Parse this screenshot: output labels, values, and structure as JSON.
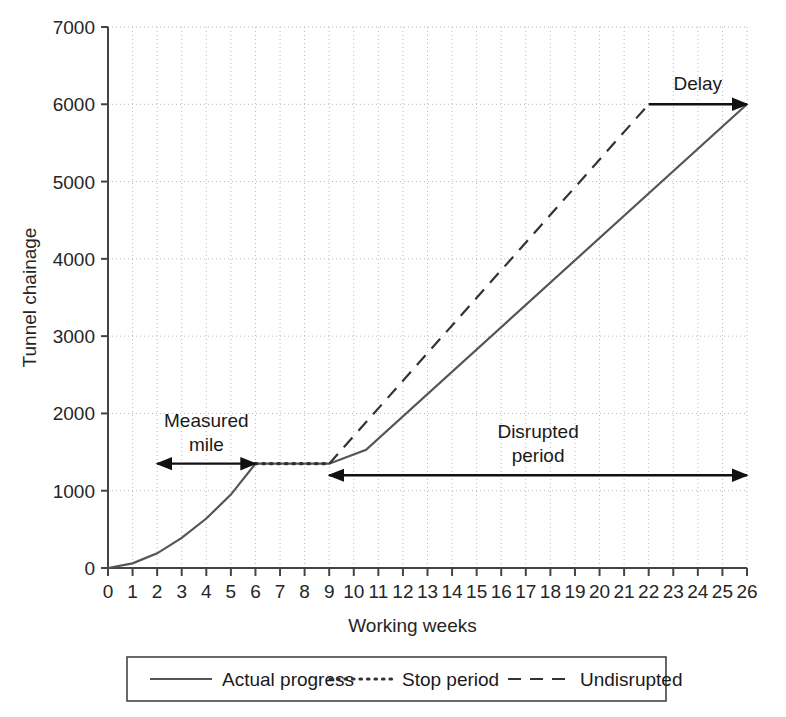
{
  "chart_data": {
    "type": "line",
    "title": "",
    "xlabel": "Working weeks",
    "ylabel": "Tunnel chainage",
    "xlim": [
      0,
      26
    ],
    "ylim": [
      0,
      7000
    ],
    "grid": true,
    "x_ticks": [
      "0",
      "1",
      "2",
      "3",
      "4",
      "5",
      "6",
      "7",
      "8",
      "9",
      "10",
      "11",
      "12",
      "13",
      "14",
      "15",
      "16",
      "17",
      "18",
      "19",
      "20",
      "21",
      "22",
      "23",
      "24",
      "25",
      "26"
    ],
    "y_ticks": [
      "0",
      "1000",
      "2000",
      "3000",
      "4000",
      "5000",
      "6000",
      "7000"
    ],
    "legend_position": "bottom",
    "series": [
      {
        "name": "Actual progress",
        "style": "solid",
        "color": "#555555",
        "x": [
          0,
          1,
          2,
          3,
          4,
          5,
          6,
          9,
          10.5,
          26
        ],
        "values": [
          0,
          60,
          190,
          390,
          640,
          950,
          1350,
          1350,
          1530,
          6000
        ]
      },
      {
        "name": "Stop period",
        "style": "dotted",
        "color": "#333333",
        "x": [
          6,
          9
        ],
        "values": [
          1350,
          1350
        ]
      },
      {
        "name": "Undisrupted",
        "style": "dashed",
        "color": "#333333",
        "x": [
          9,
          22
        ],
        "values": [
          1350,
          6000
        ]
      }
    ],
    "annotations": [
      {
        "label": "Measured\nmile",
        "line1": "Measured",
        "line2": "mile",
        "arrow": "double",
        "x_start": 2,
        "x_end": 6,
        "y": 1350
      },
      {
        "label": "Disrupted\nperiod",
        "line1": "Disrupted",
        "line2": "period",
        "arrow": "double",
        "x_start": 9,
        "x_end": 26,
        "y": 1200
      },
      {
        "label": "Delay",
        "line1": "Delay",
        "line2": "",
        "arrow": "single-right",
        "x_start": 22,
        "x_end": 26,
        "y": 6000
      }
    ]
  },
  "legend": {
    "items": [
      {
        "label": "Actual progress",
        "style": "solid"
      },
      {
        "label": "Stop period",
        "style": "dotted"
      },
      {
        "label": "Undisrupted",
        "style": "dashed"
      }
    ]
  }
}
